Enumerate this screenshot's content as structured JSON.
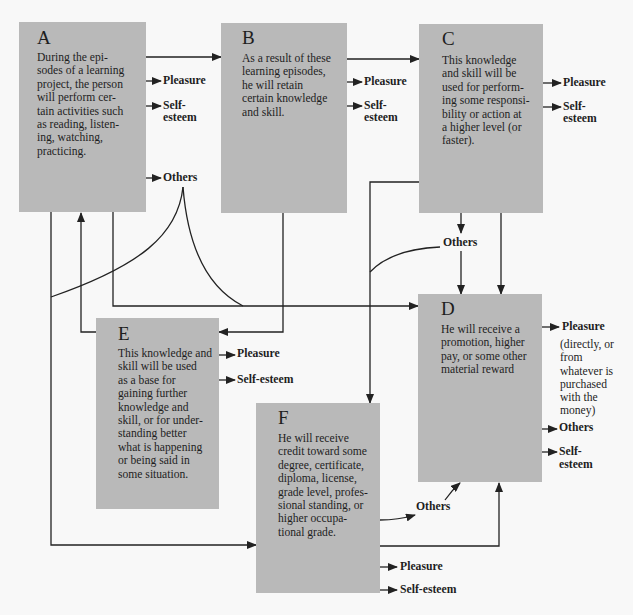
{
  "diagram": {
    "colors": {
      "box": "#b9b9b9",
      "line": "#222222",
      "background": "#f8f8f8"
    },
    "boxes": {
      "a": {
        "label": "A",
        "lines": [
          "During the epi-",
          "sodes of a learning",
          "project, the person",
          "will perform cer-",
          "tain activities such",
          "as reading, listen-",
          "ing, watching,",
          "practicing."
        ]
      },
      "b": {
        "label": "B",
        "lines": [
          "As a result of these",
          "learning episodes,",
          "he will retain",
          "certain knowledge",
          "and skill."
        ]
      },
      "c": {
        "label": "C",
        "lines": [
          "This knowledge",
          "and skill will be",
          "used for perform-",
          "ing some responsi-",
          "bility or action at",
          "a higher level (or",
          "faster)."
        ]
      },
      "d": {
        "label": "D",
        "lines": [
          "He will receive a",
          "promotion, higher",
          "pay, or some other",
          "material reward"
        ]
      },
      "e": {
        "label": "E",
        "lines": [
          "This knowledge and",
          "skill will be used",
          "as a base for",
          "gaining further",
          "knowledge and",
          "skill, or for under-",
          "standing better",
          "what is happening",
          "or being said in",
          "some situation."
        ]
      },
      "f": {
        "label": "F",
        "lines": [
          "He will receive",
          "credit toward some",
          "degree, certificate,",
          "diploma, license,",
          "grade level, profes-",
          "sional standing, or",
          "higher occupa-",
          "tional grade."
        ]
      }
    },
    "outcomes": {
      "a": {
        "pleasure": "Pleasure",
        "self_esteem": [
          "Self-",
          "esteem"
        ],
        "others": "Others"
      },
      "b": {
        "pleasure": "Pleasure",
        "self_esteem": [
          "Self-",
          "esteem"
        ]
      },
      "c": {
        "pleasure": "Pleasure",
        "self_esteem": [
          "Self-",
          "esteem"
        ],
        "others": "Others"
      },
      "d": {
        "pleasure": "Pleasure",
        "pleasure_note": [
          "(directly, or",
          "from",
          "whatever is",
          "purchased",
          "with the",
          "money)"
        ],
        "others": "Others",
        "self_esteem": [
          "Self-",
          "esteem"
        ]
      },
      "e": {
        "pleasure": "Pleasure",
        "self_esteem": "Self-esteem"
      },
      "f": {
        "others": "Others",
        "pleasure": "Pleasure",
        "self_esteem": "Self-esteem"
      }
    }
  }
}
